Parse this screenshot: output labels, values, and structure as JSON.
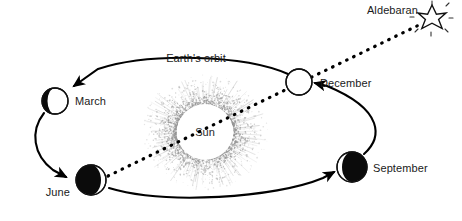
{
  "diagram": {
    "orbit_label": "Earth's orbit",
    "sun_label": "Sun",
    "star_label": "Aldebaran",
    "colors": {
      "ink": "#000000",
      "background": "#ffffff",
      "corona": "#8d8d8d",
      "text": "#1a1a1a"
    },
    "positions": [
      {
        "id": "march",
        "label": "March",
        "cx": 55,
        "cy": 101,
        "r": 13,
        "shadow": "left-crescent",
        "label_x": 75,
        "label_y": 105,
        "label_anchor": "start"
      },
      {
        "id": "june",
        "label": "June",
        "cx": 91,
        "cy": 180,
        "r": 15,
        "shadow": "left-gibbous",
        "label_x": 70,
        "label_y": 196,
        "label_anchor": "end"
      },
      {
        "id": "september",
        "label": "September",
        "cx": 352,
        "cy": 167,
        "r": 15,
        "shadow": "right-gibbous",
        "label_x": 373,
        "label_y": 172,
        "label_anchor": "start"
      },
      {
        "id": "december",
        "label": "December",
        "cx": 299,
        "cy": 82,
        "r": 13,
        "shadow": "right-sliver",
        "label_x": 320,
        "label_y": 87,
        "label_anchor": "start"
      }
    ],
    "sun": {
      "cx": 205,
      "cy": 132,
      "r": 28,
      "corona_outer": 62,
      "label_x": 205,
      "label_y": 136
    },
    "star": {
      "cx": 432,
      "cy": 17,
      "r": 11,
      "label_x": 418,
      "label_y": 14,
      "label_anchor": "end"
    },
    "sight_line": {
      "from": "june",
      "to": "aldebaran",
      "x1": 108,
      "y1": 176,
      "x2": 421,
      "y2": 24
    },
    "orbit_label_pos": {
      "x": 196,
      "y": 62
    },
    "arcs": [
      {
        "id": "arc-december-to-march",
        "from": "December",
        "to": "March",
        "arrow": "March"
      },
      {
        "id": "arc-march-to-june",
        "from": "March",
        "to": "June",
        "arrow": "June"
      },
      {
        "id": "arc-june-to-september",
        "from": "June",
        "to": "September",
        "arrow": "September"
      },
      {
        "id": "arc-september-to-december",
        "from": "September",
        "to": "December",
        "arrow": "December"
      }
    ]
  }
}
